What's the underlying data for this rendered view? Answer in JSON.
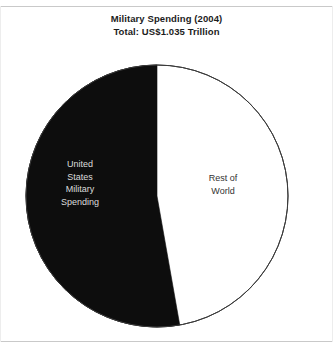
{
  "chart_data": {
    "type": "pie",
    "title": "Military Spending (2004)",
    "subtitle": "Total: US$1.035 Trillion",
    "title_lines": [
      "Military Spending (2004)",
      "Total: US$1.035 Trillion"
    ],
    "total_label": "Total: US$1.035 Trillion",
    "total_value": 1.035,
    "total_units": "US$ Trillion",
    "year": 2004,
    "categories": [
      "United States Military Spending",
      "Rest of World"
    ],
    "values": [
      52.8,
      47.2
    ],
    "value_units": "percent",
    "colors": [
      "#0d0d0d",
      "#ffffff"
    ],
    "legend": "none",
    "grid": false,
    "slices": [
      {
        "name": "United States Military Spending",
        "label_lines": [
          "United",
          "States",
          "Military",
          "Spending"
        ],
        "value": 52.8,
        "start_angle_deg": 0,
        "sweep_deg": 190,
        "fill": "#0d0d0d",
        "text_color": "#dcdcdc"
      },
      {
        "name": "Rest of World",
        "label_lines": [
          "Rest of",
          "World"
        ],
        "value": 47.2,
        "start_angle_deg": 190,
        "sweep_deg": 170,
        "fill": "#ffffff",
        "text_color": "#333333"
      }
    ],
    "geometry": {
      "center_x": 157,
      "center_y": 196,
      "radius": 131,
      "outline_color": "#3a3a3a"
    }
  },
  "frame": {
    "background": "#ffffff",
    "rule_color": "#c9c9c9"
  }
}
